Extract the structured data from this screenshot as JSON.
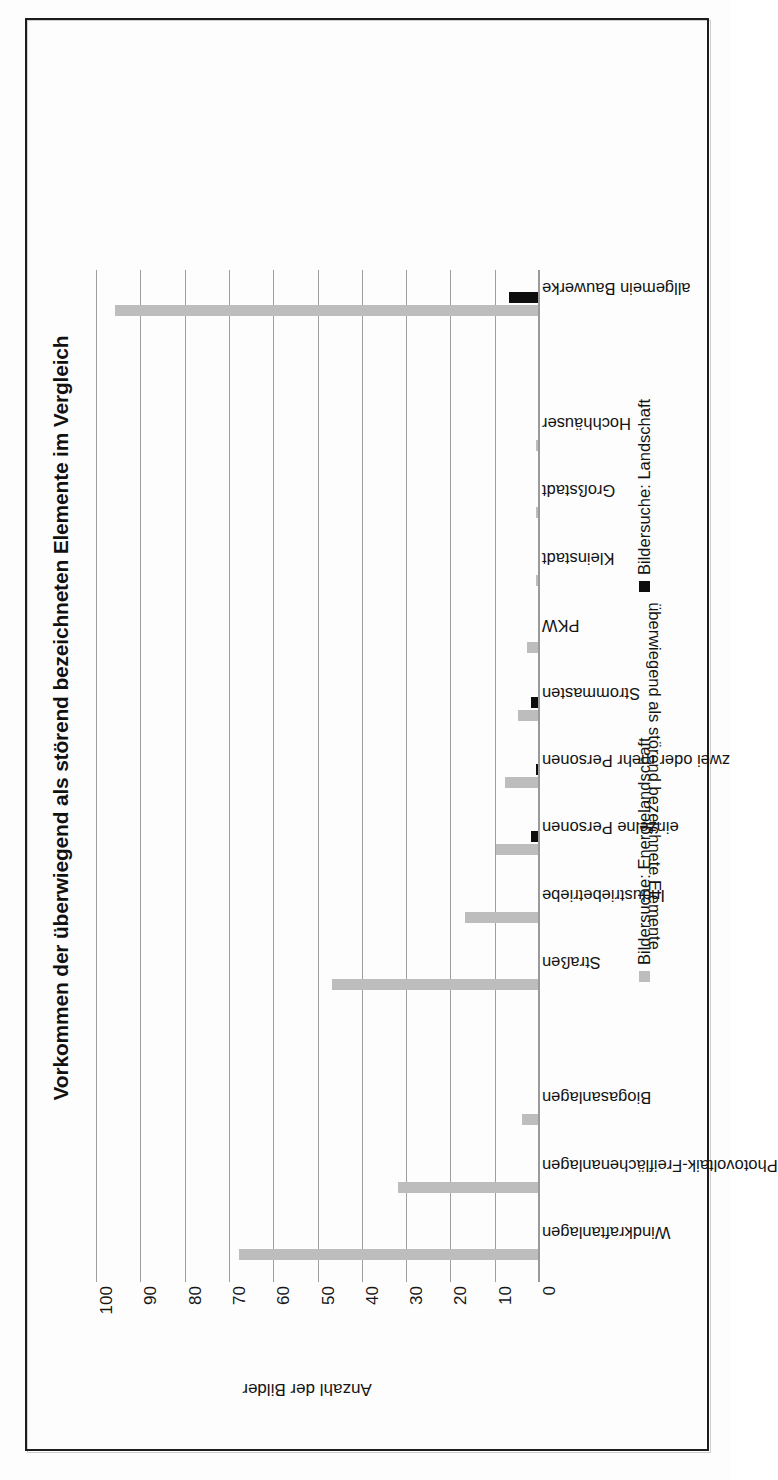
{
  "chart_data": {
    "type": "bar",
    "title": "Vorkommen der überwiegend als störend bezeichneten Elemente im Vergleich",
    "xlabel": "überwiegend als störend bezeichnete Elemente",
    "ylabel": "Anzahl der Bilder",
    "ylim": [
      0,
      100
    ],
    "yticks": [
      0,
      10,
      20,
      30,
      40,
      50,
      60,
      70,
      80,
      90,
      100
    ],
    "grid": true,
    "orientation": "vertical-bars-rotated-page",
    "legend_position": "right",
    "categories": [
      "Windkraftanlagen",
      "Photovoltaik-Freiflächenanlagen",
      "Biogasanlagen",
      "",
      "Straßen",
      "Industriebetriebe",
      "einzelne Personen",
      "zwei oder mehr Personen",
      "Strommasten",
      "PKW",
      "Kleinstadt",
      "Großstadt",
      "Hochhäuser",
      "",
      "allgemein Bauwerke"
    ],
    "series": [
      {
        "name": "Bildersuche: Energielandschaft",
        "color": "#bdbdbd",
        "values": [
          68,
          32,
          4,
          0,
          47,
          17,
          10,
          8,
          5,
          3,
          1,
          1,
          1,
          0,
          96
        ]
      },
      {
        "name": "Bildersuche: Landschaft",
        "color": "#0d0d0d",
        "values": [
          0,
          0,
          0,
          0,
          0,
          0,
          2,
          1,
          2,
          0,
          0,
          0,
          0,
          0,
          7
        ]
      }
    ]
  },
  "legend": {
    "items": [
      {
        "label": "Bildersuche: Energielandschaft",
        "swatch": "energie"
      },
      {
        "label": "Bildersuche: Landschaft",
        "swatch": "landschaft"
      }
    ]
  }
}
